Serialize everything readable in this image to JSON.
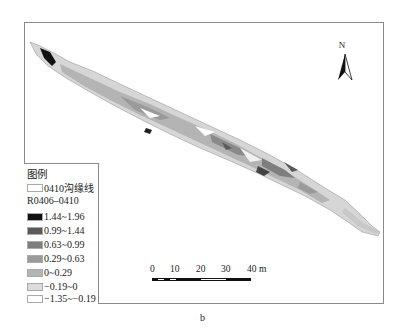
{
  "map": {
    "caption": "b",
    "north_arrow": {
      "label": "N",
      "icon": "north-arrow-icon"
    },
    "legend": {
      "title": "图例",
      "outline_item": {
        "label": "0410沟缘线",
        "color": "#ffffff"
      },
      "layer_name": "R0406–0410",
      "classes": [
        {
          "label": "1.44~1.96",
          "color": "#111111"
        },
        {
          "label": "0.99~1.44",
          "color": "#5a5a5a"
        },
        {
          "label": "0.63~0.99",
          "color": "#7e7e7e"
        },
        {
          "label": "0.29~0.63",
          "color": "#9a9a9a"
        },
        {
          "label": "0~0.29",
          "color": "#b4b4b4"
        },
        {
          "label": "−0.19~0",
          "color": "#dcdcdc"
        },
        {
          "label": "−1.35~−0.19",
          "color": "#ffffff"
        }
      ]
    },
    "scale_bar": {
      "ticks": [
        "0",
        "10",
        "20",
        "30",
        "40 m"
      ],
      "unit": "m"
    },
    "colors": {
      "frame": "#8a8a8a",
      "background": "#ffffff"
    }
  }
}
